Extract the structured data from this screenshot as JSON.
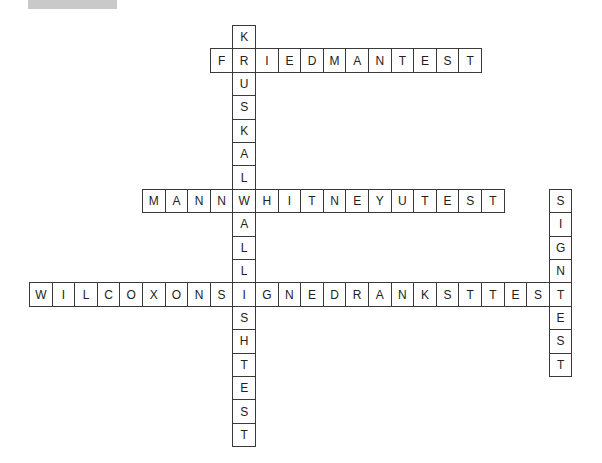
{
  "header": {
    "bar_color": "#c9c9c9"
  },
  "crossword": {
    "cell_width": 22.6,
    "cell_height": 23.4,
    "origin_x": 29,
    "origin_y": 25,
    "words": [
      {
        "id": "friedman-test",
        "answer": "FRIEDMANTEST",
        "direction": "across",
        "row": 1,
        "col": 8
      },
      {
        "id": "mann-whitney-u-test",
        "answer": "MANNWHITNEYUTEST",
        "direction": "across",
        "row": 7,
        "col": 5
      },
      {
        "id": "wilcoxon-signed-ranks-test",
        "answer": "WILCOXONSIGNEDRANKSTTEST",
        "direction": "across",
        "row": 11,
        "col": 0
      },
      {
        "id": "kruskal-wallis-h-test",
        "answer": "KRUSKALWALLISHTEST",
        "direction": "down",
        "row": 0,
        "col": 9
      },
      {
        "id": "sign-test",
        "answer": "SIGNTEST",
        "direction": "down",
        "row": 7,
        "col": 23
      }
    ]
  }
}
